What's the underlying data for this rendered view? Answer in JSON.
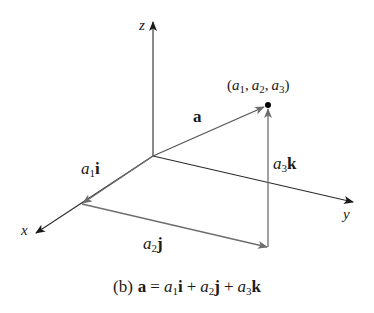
{
  "figure": {
    "caption_prefix": "(b)",
    "caption_vec": "a",
    "caption_eq": "=",
    "caption_terms": [
      {
        "coef": "a",
        "sub": "1",
        "unit": "i"
      },
      {
        "coef": "a",
        "sub": "2",
        "unit": "j"
      },
      {
        "coef": "a",
        "sub": "3",
        "unit": "k"
      }
    ],
    "plus": "+"
  },
  "axes": {
    "x": {
      "label": "x"
    },
    "y": {
      "label": "y"
    },
    "z": {
      "label": "z"
    }
  },
  "vectors": {
    "a": {
      "label": "a"
    },
    "a1i": {
      "coef": "a",
      "sub": "1",
      "unit": "i"
    },
    "a2j": {
      "coef": "a",
      "sub": "2",
      "unit": "j"
    },
    "a3k": {
      "coef": "a",
      "sub": "3",
      "unit": "k"
    }
  },
  "point": {
    "open": "(",
    "c1": "a",
    "s1": "1",
    "c2": "a",
    "s2": "2",
    "c3": "a",
    "s3": "3",
    "comma": ",",
    "close": ")"
  },
  "colors": {
    "axis": "#2b2b2b",
    "component": "#6e6e6e",
    "vector": "#555555",
    "point": "#000000"
  }
}
